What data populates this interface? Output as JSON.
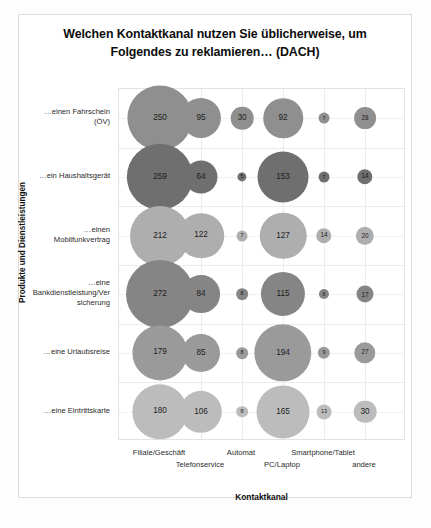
{
  "chart_data": {
    "type": "scatter",
    "title": "Welchen Kontaktkanal nutzen Sie üblicherweise, um Folgendes zu reklamieren… (DACH)",
    "title_line1": "Welchen Kontaktkanal nutzen Sie üblicherweise, um",
    "title_line2": "Folgendes zu reklamieren… (DACH)",
    "xlabel": "Kontaktkanal",
    "ylabel": "Produkte und Dienstleistungen",
    "grid": true,
    "legend": "none",
    "bubble_chart": true,
    "categories": [
      "Filiale/Geschäft",
      "Telefonservice",
      "Automat",
      "PC/Laptop",
      "Smartphone/Tablet",
      "andere"
    ],
    "rows": [
      "…einen Fahrschein (ÖV)",
      "…ein Haushaltsgerät",
      "…einen Mobilfunkvertrag",
      "…eine Bankdienstleistung/Versicherung",
      "…eine Urlaubsreise",
      "…eine Eintrittskarte"
    ],
    "row_labels_wrapped": [
      [
        "…einen Fahrschein",
        "(ÖV)"
      ],
      [
        "…ein Haushaltsgerät"
      ],
      [
        "…einen",
        "Mobilfunkvertrag"
      ],
      [
        "…eine",
        "Bankdienstleistung/Ver",
        "sicherung"
      ],
      [
        "…eine Urlaubsreise"
      ],
      [
        "…eine Eintrittskarte"
      ]
    ],
    "series": [
      {
        "name": "…einen Fahrschein (ÖV)",
        "color": "#8f8f8f",
        "values": [
          250,
          95,
          30,
          92,
          7,
          28
        ]
      },
      {
        "name": "…ein Haushaltsgerät",
        "color": "#6f6f6f",
        "values": [
          259,
          64,
          5,
          153,
          7,
          14
        ]
      },
      {
        "name": "…einen Mobilfunkvertrag",
        "color": "#aeaeae",
        "values": [
          212,
          122,
          7,
          127,
          14,
          20
        ]
      },
      {
        "name": "…eine Bankdienstleistung/Versicherung",
        "color": "#858585",
        "values": [
          272,
          84,
          8,
          115,
          6,
          17
        ]
      },
      {
        "name": "…eine Urlaubsreise",
        "color": "#9a9a9a",
        "values": [
          179,
          85,
          8,
          194,
          9,
          27
        ]
      },
      {
        "name": "…eine Eintrittskarte",
        "color": "#bcbcbc",
        "values": [
          180,
          106,
          8,
          165,
          13,
          30
        ]
      }
    ],
    "value_labels_hidden_below": 6,
    "max_value": 272,
    "min_value": 5
  },
  "colors": {
    "frame": "#dcdcdc",
    "grid": "#ececec",
    "text": "#1a1a1a",
    "plot_background": "#ffffff"
  }
}
